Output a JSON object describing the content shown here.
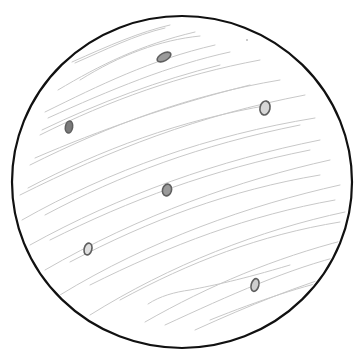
{
  "drawing": {
    "subject": "pencil sketch of a circle with diagonal hatching and six small elliptical spots",
    "background": "#ffffff",
    "outline": {
      "cx": 182,
      "cy": 182,
      "rx": 170,
      "ry": 166,
      "stroke": "#111111",
      "stroke_width": 2.2
    },
    "hatch_color": "#c8c8c8",
    "spot_color": "#6f6f6f",
    "spots": [
      {
        "cx": 164,
        "cy": 57,
        "rx": 7.5,
        "ry": 3.8,
        "rotate": -28
      },
      {
        "cx": 265,
        "cy": 108,
        "rx": 5,
        "ry": 7,
        "rotate": 12
      },
      {
        "cx": 69,
        "cy": 127,
        "rx": 3.6,
        "ry": 6,
        "rotate": 10
      },
      {
        "cx": 167,
        "cy": 190,
        "rx": 4.5,
        "ry": 6,
        "rotate": 15
      },
      {
        "cx": 88,
        "cy": 249,
        "rx": 3.8,
        "ry": 6,
        "rotate": 15
      },
      {
        "cx": 255,
        "cy": 285,
        "rx": 3.8,
        "ry": 6.5,
        "rotate": 15
      }
    ],
    "stray_dot": {
      "cx": 247,
      "cy": 40,
      "r": 0.8
    }
  }
}
